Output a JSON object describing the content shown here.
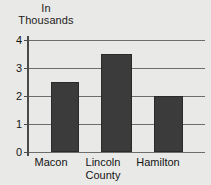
{
  "chart_data": {
    "type": "bar",
    "title": "In Thousands",
    "title_lines": [
      "In",
      "Thousands"
    ],
    "xlabel": "",
    "ylabel": "In Thousands",
    "categories": [
      "Macon",
      "Lincoln County",
      "Hamilton"
    ],
    "category_lines": [
      [
        "Macon"
      ],
      [
        "Lincoln",
        "County"
      ],
      [
        "Hamilton"
      ]
    ],
    "values": [
      2.5,
      3.5,
      2.0
    ],
    "ylim": [
      0,
      4
    ],
    "ytick_labels": [
      "0",
      "1",
      "2",
      "3",
      "4"
    ],
    "ytick_values": [
      0,
      1,
      2,
      3,
      4
    ],
    "grid": true,
    "grid_axis": "y",
    "legend": false,
    "colors": {
      "bar_fill": "#3b3b3b",
      "bar_edge": "#2a2a2a",
      "gridline": "#6d6d6d",
      "axis": "#4a4a4a",
      "background": "#e9e9e7",
      "text": "#141414"
    }
  }
}
